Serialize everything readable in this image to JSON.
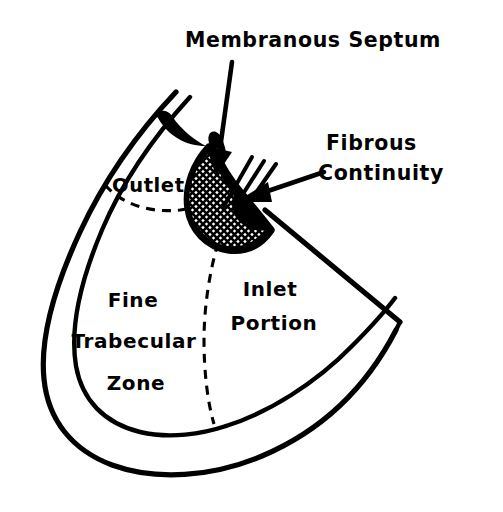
{
  "figure": {
    "type": "anatomical-line-diagram",
    "background_color": "#ffffff",
    "ink_color": "#000000"
  },
  "callouts": [
    {
      "id": "membranous-septum",
      "line1": "Membranous Septum",
      "line2": "",
      "text_x": 196,
      "text_y": 47,
      "anchor": "middle",
      "arrow_from": [
        232,
        62
      ],
      "arrow_to": [
        216,
        168
      ]
    },
    {
      "id": "fibrous-continuity",
      "line1": "Fibrous",
      "line2": "Continuity",
      "text_x": 326,
      "text_y": 139,
      "anchor": "start",
      "arrow_from": [
        324,
        172
      ],
      "arrow_to": [
        238,
        200
      ]
    }
  ],
  "regions": [
    {
      "id": "outlet",
      "label": "Outlet",
      "lines": [
        "Outlet"
      ],
      "x": 118,
      "y": 192
    },
    {
      "id": "inlet-portion",
      "label": "Inlet Portion",
      "lines": [
        "Inlet",
        "Portion"
      ],
      "x": 272,
      "y": 292
    },
    {
      "id": "fine-trabecular-zone",
      "label": "Fine Trabecular Zone",
      "lines": [
        "Fine",
        "Trabecular",
        "Zone"
      ],
      "x": 134,
      "y": 305
    }
  ],
  "features": [
    {
      "id": "hatched-septum-patch",
      "name": "Membranous septum (cross-hatched patch)"
    },
    {
      "id": "fibrous-strands",
      "name": "Fibrous continuity strands",
      "count": 3
    },
    {
      "id": "outer-myocardial-wall",
      "name": "Outer ventricular wall"
    },
    {
      "id": "inner-myocardial-wall",
      "name": "Inner ventricular wall"
    },
    {
      "id": "outlet-boundary-dashed",
      "name": "Outlet boundary (dashed)"
    },
    {
      "id": "inlet-boundary-dashed",
      "name": "Inlet/trabecular boundary (dashed)"
    },
    {
      "id": "valve-leaflet-arc",
      "name": "Valve leaflet arc"
    },
    {
      "id": "apex-point",
      "name": "Right apex point"
    }
  ]
}
